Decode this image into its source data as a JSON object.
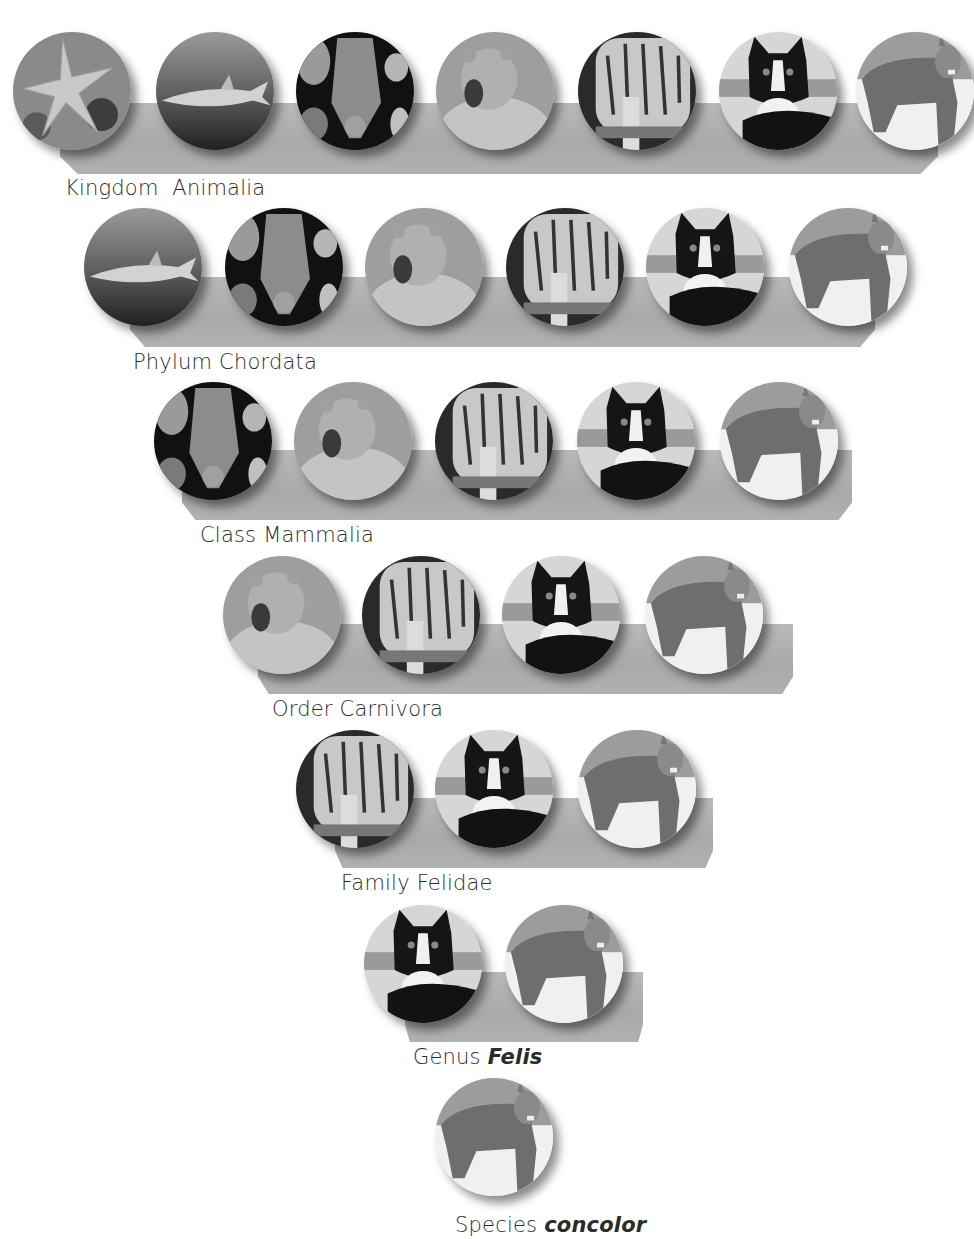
{
  "diagram": {
    "type": "taxonomy-hierarchy",
    "levels": [
      {
        "rank": "Kingdom",
        "name": "Animalia",
        "italic": false,
        "organisms": [
          "sea-star",
          "shark",
          "bat",
          "bear",
          "tiger",
          "domestic-cat",
          "cougar"
        ]
      },
      {
        "rank": "Phylum",
        "name": "Chordata",
        "italic": false,
        "organisms": [
          "shark",
          "bat",
          "bear",
          "tiger",
          "domestic-cat",
          "cougar"
        ]
      },
      {
        "rank": "Class",
        "name": "Mammalia",
        "italic": false,
        "organisms": [
          "bat",
          "bear",
          "tiger",
          "domestic-cat",
          "cougar"
        ]
      },
      {
        "rank": "Order",
        "name": "Carnivora",
        "italic": false,
        "organisms": [
          "bear",
          "tiger",
          "domestic-cat",
          "cougar"
        ]
      },
      {
        "rank": "Family",
        "name": "Felidae",
        "italic": false,
        "organisms": [
          "tiger",
          "domestic-cat",
          "cougar"
        ]
      },
      {
        "rank": "Genus",
        "name": "Felis",
        "italic": true,
        "organisms": [
          "domestic-cat",
          "cougar"
        ]
      },
      {
        "rank": "Species",
        "name": "concolor",
        "italic": true,
        "organisms": [
          "cougar"
        ]
      }
    ]
  },
  "labels": {
    "kingdom": {
      "rank": "Kingdom",
      "name": "Animalia"
    },
    "phylum": {
      "rank": "Phylum",
      "name": "Chordata"
    },
    "class": {
      "rank": "Class",
      "name": "Mammalia"
    },
    "order": {
      "rank": "Order",
      "name": "Carnivora"
    },
    "family": {
      "rank": "Family",
      "name": "Felidae"
    },
    "genus": {
      "rank": "Genus",
      "name": "Felis"
    },
    "species": {
      "rank": "Species",
      "name": "concolor"
    }
  },
  "colors": {
    "band": "#adadad",
    "text": "#2b2b2b",
    "background": "#ffffff"
  }
}
